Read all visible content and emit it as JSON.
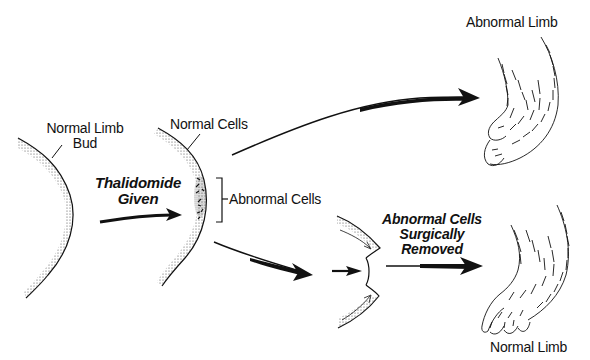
{
  "diagram": {
    "labels": {
      "normal_limb_bud_line1": "Normal Limb",
      "normal_limb_bud_line2": "Bud",
      "normal_cells": "Normal Cells",
      "abnormal_cells": "Abnormal Cells",
      "thalidomide_line1": "Thalidomide",
      "thalidomide_line2": "Given",
      "removed_line1": "Abnormal Cells",
      "removed_line2": "Surgically",
      "removed_line3": "Removed",
      "abnormal_limb": "Abnormal Limb",
      "normal_limb": "Normal Limb"
    },
    "stages": [
      {
        "name": "normal-limb-bud",
        "label": "Normal Limb Bud"
      },
      {
        "name": "treated-limb-bud",
        "label": "Normal Cells / Abnormal Cells"
      },
      {
        "name": "abnormal-limb",
        "label": "Abnormal Limb"
      },
      {
        "name": "surgically-corrected-bud",
        "label": "Abnormal Cells Surgically Removed"
      },
      {
        "name": "normal-limb",
        "label": "Normal Limb"
      }
    ],
    "colors": {
      "ink": "#111111",
      "background": "#ffffff"
    }
  }
}
